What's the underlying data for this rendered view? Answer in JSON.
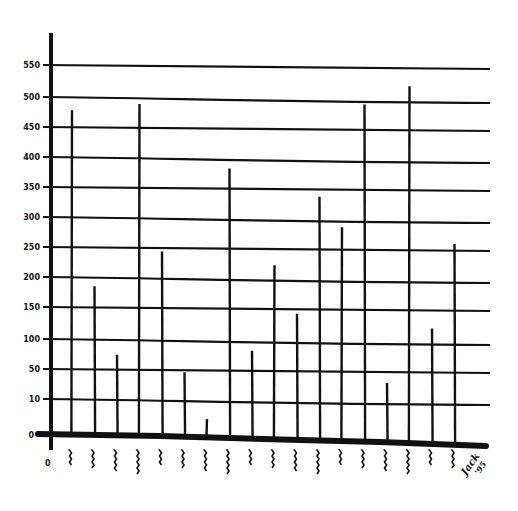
{
  "chart_data": {
    "type": "bar",
    "style": "hand-drawn stick bars",
    "title": "",
    "xlabel": "",
    "ylabel": "",
    "ylim": [
      0,
      550
    ],
    "grid": true,
    "legend": null,
    "y_ticks": [
      0,
      10,
      50,
      100,
      150,
      200,
      250,
      300,
      350,
      400,
      450,
      500,
      550
    ],
    "y_tick_labels": [
      "0",
      "10",
      "50",
      "100",
      "150",
      "200",
      "250",
      "300",
      "350",
      "400",
      "450",
      "500",
      "550"
    ],
    "x_origin_label": "0",
    "categories": [
      "1",
      "2",
      "3",
      "4",
      "5",
      "6",
      "7",
      "8",
      "9",
      "10",
      "11",
      "12",
      "13",
      "14",
      "15",
      "16",
      "17",
      "18"
    ],
    "category_labels_note": "illegible hand-written scribbles under each bar",
    "values": [
      478,
      185,
      75,
      490,
      245,
      48,
      5,
      385,
      85,
      225,
      145,
      340,
      290,
      495,
      38,
      525,
      125,
      265
    ],
    "annotations": [
      "signature: Jack '95"
    ]
  },
  "colors": {
    "ink": "#111111",
    "paper": "#ffffff"
  },
  "signature": {
    "name": "Jack",
    "year": "'95"
  },
  "axis": {
    "origin_label": "0"
  }
}
